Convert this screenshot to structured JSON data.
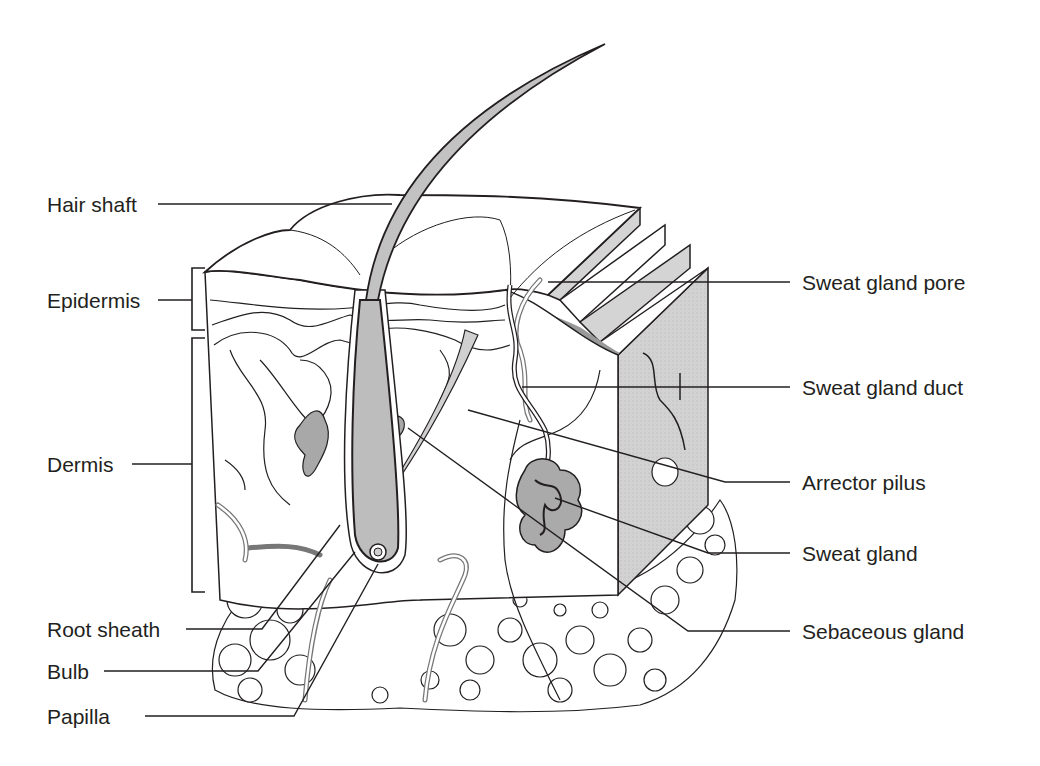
{
  "diagram": {
    "style": {
      "ink": "#231f20",
      "shade": "#c8c8c8",
      "dark_shade": "#9a9a9a",
      "background": "#ffffff"
    },
    "labels_left": [
      {
        "id": "hair-shaft",
        "text": "Hair shaft"
      },
      {
        "id": "epidermis",
        "text": "Epidermis"
      },
      {
        "id": "dermis",
        "text": "Dermis"
      },
      {
        "id": "root-sheath",
        "text": "Root sheath"
      },
      {
        "id": "bulb",
        "text": "Bulb"
      },
      {
        "id": "papilla",
        "text": "Papilla"
      }
    ],
    "labels_right": [
      {
        "id": "sweat-gland-pore",
        "text": "Sweat gland pore"
      },
      {
        "id": "sweat-gland-duct",
        "text": "Sweat gland duct"
      },
      {
        "id": "arrector-pilus",
        "text": "Arrector pilus"
      },
      {
        "id": "sweat-gland",
        "text": "Sweat gland"
      },
      {
        "id": "sebaceous-gland",
        "text": "Sebaceous gland"
      }
    ]
  }
}
